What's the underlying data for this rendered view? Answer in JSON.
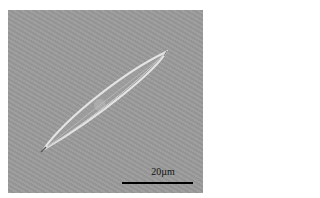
{
  "image": {
    "subject": "diatom",
    "background_color": "#9a9a9a",
    "outline_color": "#e6e6e6"
  },
  "scale_bar": {
    "label": "20µm",
    "color": "#000000"
  }
}
